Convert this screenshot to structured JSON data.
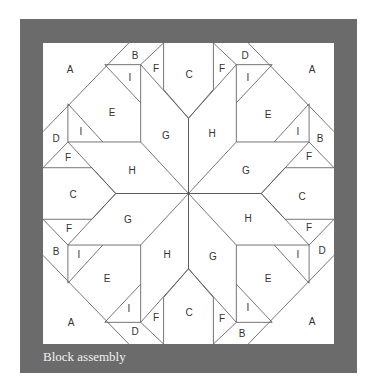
{
  "caption": "Block assembly",
  "colors": {
    "frame": "#6b6b6b",
    "block": "#ffffff",
    "line": "#555555"
  },
  "labels": [
    {
      "t": "A",
      "x": 70,
      "y": 69
    },
    {
      "t": "B",
      "x": 135,
      "y": 55
    },
    {
      "t": "I",
      "x": 130,
      "y": 77
    },
    {
      "t": "F",
      "x": 156,
      "y": 68
    },
    {
      "t": "C",
      "x": 189,
      "y": 74
    },
    {
      "t": "F",
      "x": 222,
      "y": 68
    },
    {
      "t": "D",
      "x": 245,
      "y": 55
    },
    {
      "t": "I",
      "x": 248,
      "y": 77
    },
    {
      "t": "A",
      "x": 312,
      "y": 69
    },
    {
      "t": "E",
      "x": 112,
      "y": 112
    },
    {
      "t": "E",
      "x": 268,
      "y": 114
    },
    {
      "t": "G",
      "x": 166,
      "y": 135
    },
    {
      "t": "H",
      "x": 212,
      "y": 133
    },
    {
      "t": "D",
      "x": 56,
      "y": 138
    },
    {
      "t": "I",
      "x": 81,
      "y": 131
    },
    {
      "t": "I",
      "x": 298,
      "y": 131
    },
    {
      "t": "B",
      "x": 320,
      "y": 138
    },
    {
      "t": "F",
      "x": 68,
      "y": 157
    },
    {
      "t": "F",
      "x": 309,
      "y": 156
    },
    {
      "t": "H",
      "x": 132,
      "y": 170
    },
    {
      "t": "G",
      "x": 246,
      "y": 170
    },
    {
      "t": "C",
      "x": 73,
      "y": 194
    },
    {
      "t": "C",
      "x": 302,
      "y": 196
    },
    {
      "t": "G",
      "x": 128,
      "y": 219
    },
    {
      "t": "H",
      "x": 248,
      "y": 218
    },
    {
      "t": "F",
      "x": 69,
      "y": 228
    },
    {
      "t": "F",
      "x": 309,
      "y": 227
    },
    {
      "t": "B",
      "x": 56,
      "y": 251
    },
    {
      "t": "I",
      "x": 79,
      "y": 254
    },
    {
      "t": "I",
      "x": 298,
      "y": 254
    },
    {
      "t": "D",
      "x": 322,
      "y": 250
    },
    {
      "t": "H",
      "x": 167,
      "y": 254
    },
    {
      "t": "G",
      "x": 213,
      "y": 256
    },
    {
      "t": "E",
      "x": 107,
      "y": 278
    },
    {
      "t": "E",
      "x": 268,
      "y": 278
    },
    {
      "t": "I",
      "x": 129,
      "y": 308
    },
    {
      "t": "I",
      "x": 248,
      "y": 307
    },
    {
      "t": "A",
      "x": 71,
      "y": 322
    },
    {
      "t": "A",
      "x": 312,
      "y": 321
    },
    {
      "t": "F",
      "x": 156,
      "y": 317
    },
    {
      "t": "C",
      "x": 189,
      "y": 312
    },
    {
      "t": "F",
      "x": 222,
      "y": 318
    },
    {
      "t": "D",
      "x": 135,
      "y": 331
    },
    {
      "t": "B",
      "x": 242,
      "y": 333
    }
  ]
}
